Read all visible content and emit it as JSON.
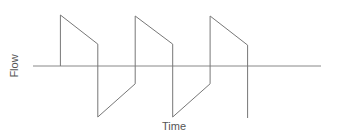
{
  "chart_data": {
    "type": "line",
    "title": "",
    "xlabel": "Time",
    "ylabel": "Flow",
    "grid": false,
    "legend": null,
    "ylim": [
      -1.0,
      1.0
    ],
    "xlim": [
      0,
      10
    ],
    "series": [
      {
        "name": "Flow",
        "color": "#777777",
        "points": [
          [
            0.95,
            0.0
          ],
          [
            0.95,
            1.0
          ],
          [
            2.25,
            0.43
          ],
          [
            2.25,
            -1.0
          ],
          [
            3.55,
            -0.35
          ],
          [
            3.55,
            0.98
          ],
          [
            4.85,
            0.43
          ],
          [
            4.85,
            -1.0
          ],
          [
            6.15,
            -0.35
          ],
          [
            6.15,
            0.98
          ],
          [
            7.45,
            0.41
          ],
          [
            7.45,
            -1.02
          ]
        ]
      }
    ],
    "axis": {
      "zero_line_from_x": 0,
      "zero_line_to_x": 10
    }
  },
  "labels": {
    "x": "Time",
    "y": "Flow"
  },
  "colors": {
    "line": "#777777",
    "axis": "#888888",
    "text": "#555555"
  }
}
